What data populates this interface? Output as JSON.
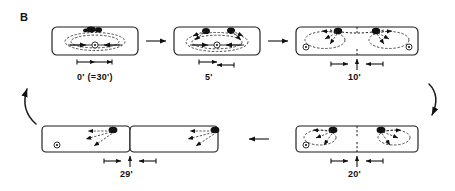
{
  "figure": {
    "panel_letter": "B",
    "caption_type": "cell-division-time-series",
    "background_color": "#ffffff",
    "ink_color": "#111111"
  },
  "panels": [
    {
      "id": "panel-0",
      "time_label": "0' (=30')",
      "stage": "metaphase",
      "row": "top",
      "column": 1,
      "chromosome_clusters": 1,
      "centriole_marks": 1,
      "furrow": false,
      "divided": false
    },
    {
      "id": "panel-5",
      "time_label": "5'",
      "stage": "early-anaphase",
      "row": "top",
      "column": 2,
      "chromosome_clusters": 2,
      "centriole_marks": 1,
      "furrow": false,
      "divided": false
    },
    {
      "id": "panel-10",
      "time_label": "10'",
      "stage": "late-anaphase",
      "row": "top",
      "column": 3,
      "chromosome_clusters": 2,
      "centriole_marks": 2,
      "furrow": true,
      "divided": false
    },
    {
      "id": "panel-20",
      "time_label": "20'",
      "stage": "telophase",
      "row": "bottom",
      "column": 2,
      "chromosome_clusters": 2,
      "centriole_marks": 1,
      "furrow": true,
      "divided": false
    },
    {
      "id": "panel-29",
      "time_label": "29'",
      "stage": "cytokinesis-complete",
      "row": "bottom",
      "column": 1,
      "chromosome_clusters": 2,
      "centriole_marks": 1,
      "furrow": false,
      "divided": true
    }
  ],
  "connectors": [
    {
      "id": "arrow-0-to-5",
      "direction": "right",
      "row": "top"
    },
    {
      "id": "arrow-5-to-10",
      "direction": "right",
      "row": "top"
    },
    {
      "id": "arrow-20-to-29",
      "direction": "left",
      "row": "bottom"
    },
    {
      "id": "flow-curve-right",
      "direction": "down",
      "side": "right"
    },
    {
      "id": "flow-curve-left",
      "direction": "up-left",
      "side": "left"
    }
  ],
  "measurement_marks": {
    "panel-0": {
      "type": "double-headed-span",
      "segments": 2
    },
    "panel-5": {
      "type": "double-headed-span",
      "segments": 2
    },
    "panel-10": {
      "type": "span-with-center-tick",
      "segments": 2,
      "center_arrow": "up"
    },
    "panel-20": {
      "type": "span-with-center-tick",
      "segments": 2,
      "center_arrow": "up"
    },
    "panel-29": {
      "type": "span-with-center-tick",
      "segments": 2,
      "center_arrow": "up"
    }
  }
}
